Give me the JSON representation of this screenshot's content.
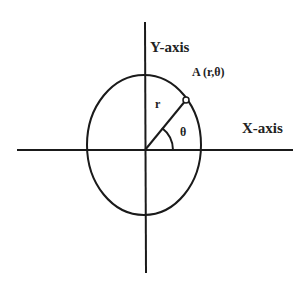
{
  "diagram": {
    "labels": {
      "y_axis": "Y-axis",
      "x_axis": "X-axis",
      "point": "A (r,θ)",
      "radius": "r",
      "angle": "θ"
    },
    "colors": {
      "stroke": "#1a1a1a",
      "text": "#222222",
      "background": "#ffffff"
    }
  }
}
